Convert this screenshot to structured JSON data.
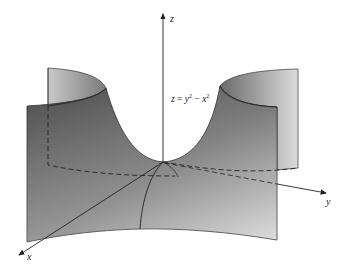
{
  "figure": {
    "type": "3d-surface-diagram",
    "surface_equation": {
      "lhs": "z",
      "eq": " = ",
      "term1_base": "y",
      "term1_exp": "2",
      "minus": " − ",
      "term2_base": "x",
      "term2_exp": "2"
    },
    "axes": {
      "x_label": "x",
      "y_label": "y",
      "z_label": "z"
    },
    "colors": {
      "surface_dark": "#5f5f5f",
      "surface_light": "#d6d6d6",
      "lines": "#222222",
      "background": "#ffffff"
    }
  }
}
